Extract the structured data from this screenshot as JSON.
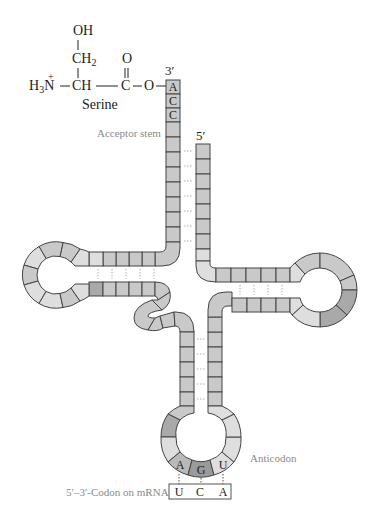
{
  "molecule": {
    "amino_acid": {
      "name": "Serine",
      "side_chain_top": "OH",
      "side_chain_mid": "CH",
      "side_chain_mid_sub": "2",
      "amine_left": "H",
      "amine_sub": "3",
      "amine_N": "N",
      "amine_charge": "+",
      "alpha_carbon": "CH",
      "carbonyl_O": "O",
      "carbonyl_C": "C",
      "ester_O": "O"
    },
    "labels": {
      "three_prime": "3′",
      "five_prime": "5′",
      "acceptor_stem": "Acceptor stem",
      "anticodon": "Anticodon",
      "codon_label": "5′–3′-Codon on mRNA"
    },
    "acceptor_end_bases": [
      "A",
      "C",
      "C"
    ],
    "anticodon_bases": [
      "A",
      "G",
      "U"
    ],
    "codon_bases": [
      "U",
      "C",
      "A"
    ]
  },
  "colors": {
    "cell_default": "#c9c9c9",
    "cell_light": "#dedede",
    "cell_dark": "#9f9f9f",
    "cell_medium": "#b4b4b4",
    "outline": "#444444",
    "hbond": "#b0b0b0",
    "label_grey": "#8a8a8a"
  }
}
